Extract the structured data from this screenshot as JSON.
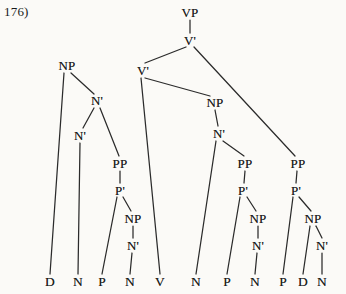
{
  "figure": {
    "example_label": "176)",
    "type": "syntax-tree",
    "width": 346,
    "height": 294,
    "ink_color": "#2b2b2b",
    "background_color": "#fbfaf7"
  },
  "tree": {
    "nodes": [
      {
        "id": "vp",
        "label": "VP",
        "x": 190,
        "y": 12
      },
      {
        "id": "vbar-top",
        "label": "V'",
        "x": 190,
        "y": 40
      },
      {
        "id": "vbar-mid",
        "label": "V'",
        "x": 143,
        "y": 70
      },
      {
        "id": "np-left",
        "label": "NP",
        "x": 67,
        "y": 65
      },
      {
        "id": "nbar-l1",
        "label": "N'",
        "x": 97,
        "y": 100
      },
      {
        "id": "nbar-l2",
        "label": "N'",
        "x": 80,
        "y": 135
      },
      {
        "id": "pp-left",
        "label": "PP",
        "x": 120,
        "y": 163
      },
      {
        "id": "pbar-left",
        "label": "P'",
        "x": 120,
        "y": 190
      },
      {
        "id": "np-l3",
        "label": "NP",
        "x": 133,
        "y": 218
      },
      {
        "id": "nbar-l3",
        "label": "N'",
        "x": 133,
        "y": 245
      },
      {
        "id": "np-mid",
        "label": "NP",
        "x": 215,
        "y": 102
      },
      {
        "id": "nbar-mid",
        "label": "N'",
        "x": 219,
        "y": 133
      },
      {
        "id": "pp-mid",
        "label": "PP",
        "x": 245,
        "y": 163
      },
      {
        "id": "pbar-mid",
        "label": "P'",
        "x": 243,
        "y": 190
      },
      {
        "id": "np-mid2",
        "label": "NP",
        "x": 258,
        "y": 218
      },
      {
        "id": "nbar-mid2",
        "label": "N'",
        "x": 258,
        "y": 245
      },
      {
        "id": "pp-right",
        "label": "PP",
        "x": 298,
        "y": 163
      },
      {
        "id": "pbar-right",
        "label": "P'",
        "x": 296,
        "y": 190
      },
      {
        "id": "np-right",
        "label": "NP",
        "x": 313,
        "y": 218
      },
      {
        "id": "nbar-right",
        "label": "N'",
        "x": 322,
        "y": 245
      }
    ],
    "terminals": [
      {
        "id": "t1",
        "label": "D",
        "x": 50,
        "y": 282
      },
      {
        "id": "t2",
        "label": "N",
        "x": 78,
        "y": 282
      },
      {
        "id": "t3",
        "label": "P",
        "x": 102,
        "y": 282
      },
      {
        "id": "t4",
        "label": "N",
        "x": 130,
        "y": 282
      },
      {
        "id": "t5",
        "label": "V",
        "x": 160,
        "y": 282
      },
      {
        "id": "t6",
        "label": "N",
        "x": 196,
        "y": 282
      },
      {
        "id": "t7",
        "label": "P",
        "x": 227,
        "y": 282
      },
      {
        "id": "t8",
        "label": "N",
        "x": 255,
        "y": 282
      },
      {
        "id": "t9",
        "label": "P",
        "x": 283,
        "y": 282
      },
      {
        "id": "t10",
        "label": "D",
        "x": 303,
        "y": 282
      },
      {
        "id": "t11",
        "label": "N",
        "x": 322,
        "y": 282
      }
    ],
    "edges": [
      {
        "from": "vp",
        "to": "vbar-top",
        "x1": 190,
        "y1": 20,
        "x2": 190,
        "y2": 33
      },
      {
        "from": "vbar-top",
        "to": "vbar-mid",
        "x1": 186,
        "y1": 47,
        "x2": 145,
        "y2": 63
      },
      {
        "from": "vbar-top",
        "to": "pp-right",
        "x1": 194,
        "y1": 47,
        "x2": 295,
        "y2": 156
      },
      {
        "from": "vbar-mid",
        "to": "t5",
        "x1": 141,
        "y1": 78,
        "x2": 160,
        "y2": 274
      },
      {
        "from": "vbar-mid",
        "to": "np-mid",
        "x1": 145,
        "y1": 78,
        "x2": 210,
        "y2": 96
      },
      {
        "from": "np-left",
        "to": "t1",
        "x1": 64,
        "y1": 73,
        "x2": 50,
        "y2": 274
      },
      {
        "from": "np-left",
        "to": "nbar-l1",
        "x1": 71,
        "y1": 73,
        "x2": 94,
        "y2": 94
      },
      {
        "from": "nbar-l1",
        "to": "nbar-l2",
        "x1": 94,
        "y1": 108,
        "x2": 83,
        "y2": 128
      },
      {
        "from": "nbar-l1",
        "to": "pp-left",
        "x1": 100,
        "y1": 108,
        "x2": 119,
        "y2": 156
      },
      {
        "from": "nbar-l2",
        "to": "t2",
        "x1": 80,
        "y1": 143,
        "x2": 78,
        "y2": 274
      },
      {
        "from": "pp-left",
        "to": "pbar-left",
        "x1": 120,
        "y1": 171,
        "x2": 120,
        "y2": 183
      },
      {
        "from": "pbar-left",
        "to": "t3",
        "x1": 117,
        "y1": 197,
        "x2": 102,
        "y2": 274
      },
      {
        "from": "pbar-left",
        "to": "np-l3",
        "x1": 123,
        "y1": 197,
        "x2": 131,
        "y2": 211
      },
      {
        "from": "np-l3",
        "to": "nbar-l3",
        "x1": 133,
        "y1": 226,
        "x2": 133,
        "y2": 238
      },
      {
        "from": "nbar-l3",
        "to": "t4",
        "x1": 132,
        "y1": 253,
        "x2": 130,
        "y2": 274
      },
      {
        "from": "np-mid",
        "to": "nbar-mid",
        "x1": 215,
        "y1": 110,
        "x2": 218,
        "y2": 126
      },
      {
        "from": "nbar-mid",
        "to": "t6",
        "x1": 216,
        "y1": 141,
        "x2": 196,
        "y2": 274
      },
      {
        "from": "nbar-mid",
        "to": "pp-mid",
        "x1": 223,
        "y1": 141,
        "x2": 244,
        "y2": 156
      },
      {
        "from": "pp-mid",
        "to": "pbar-mid",
        "x1": 245,
        "y1": 171,
        "x2": 244,
        "y2": 183
      },
      {
        "from": "pbar-mid",
        "to": "t7",
        "x1": 240,
        "y1": 197,
        "x2": 227,
        "y2": 274
      },
      {
        "from": "pbar-mid",
        "to": "np-mid2",
        "x1": 247,
        "y1": 197,
        "x2": 256,
        "y2": 211
      },
      {
        "from": "np-mid2",
        "to": "nbar-mid2",
        "x1": 258,
        "y1": 226,
        "x2": 258,
        "y2": 238
      },
      {
        "from": "nbar-mid2",
        "to": "t8",
        "x1": 257,
        "y1": 253,
        "x2": 255,
        "y2": 274
      },
      {
        "from": "pp-right",
        "to": "pbar-right",
        "x1": 297,
        "y1": 171,
        "x2": 296,
        "y2": 183
      },
      {
        "from": "pbar-right",
        "to": "t9",
        "x1": 293,
        "y1": 197,
        "x2": 283,
        "y2": 274
      },
      {
        "from": "pbar-right",
        "to": "np-right",
        "x1": 299,
        "y1": 197,
        "x2": 311,
        "y2": 211
      },
      {
        "from": "np-right",
        "to": "t10",
        "x1": 310,
        "y1": 226,
        "x2": 303,
        "y2": 274
      },
      {
        "from": "np-right",
        "to": "nbar-right",
        "x1": 316,
        "y1": 226,
        "x2": 322,
        "y2": 238
      },
      {
        "from": "nbar-right",
        "to": "t11",
        "x1": 322,
        "y1": 253,
        "x2": 322,
        "y2": 274
      }
    ]
  }
}
